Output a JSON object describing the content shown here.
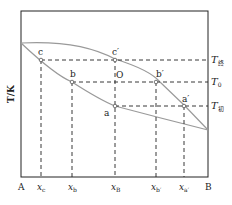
{
  "diagram": {
    "type": "binary phase diagram (T-x, boiling point / liquidus-vapor)",
    "y_axis_label": "T/K",
    "x_axis_ends": {
      "left": "A",
      "right": "B"
    },
    "x_ticks": [
      {
        "id": "xc",
        "label": "x",
        "sub": "c"
      },
      {
        "id": "xb",
        "label": "x",
        "sub": "b"
      },
      {
        "id": "xB",
        "label": "x",
        "sub": "B"
      },
      {
        "id": "xb_prime",
        "label": "x",
        "sub": "b′"
      },
      {
        "id": "xa_prime",
        "label": "x",
        "sub": "a′"
      }
    ],
    "temperature_levels": [
      {
        "id": "T_final",
        "label": "T",
        "sub": "终"
      },
      {
        "id": "T_0",
        "label": "T",
        "sub": "0"
      },
      {
        "id": "T_initial",
        "label": "T",
        "sub": "初"
      }
    ],
    "points": {
      "c": "c",
      "c_prime": "c′",
      "b": "b",
      "b_prime": "b′",
      "O": "O",
      "a": "a",
      "a_prime": "a′"
    },
    "colors": {
      "frame": "#222222",
      "curve": "#9a9a9a",
      "dashed": "#222222"
    }
  }
}
